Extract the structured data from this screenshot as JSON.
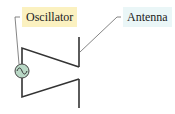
{
  "diagram": {
    "labels": {
      "oscillator": "Oscillator",
      "antenna": "Antenna"
    },
    "colors": {
      "oscillator_label_bg": "#fbf1c0",
      "antenna_label_bg": "#eaf6f7",
      "source_fill": "#b9d8c6",
      "wire": "#333333"
    },
    "components": [
      "AC oscillator source",
      "dipole antenna",
      "transmission wires"
    ]
  }
}
